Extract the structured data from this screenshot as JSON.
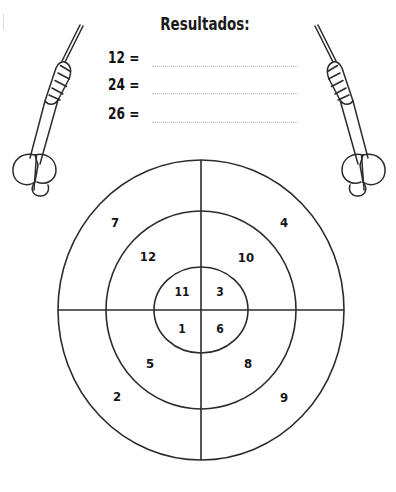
{
  "worksheet": {
    "results": {
      "title": "Resultados:",
      "rows": [
        {
          "label": "12 =",
          "answer": ""
        },
        {
          "label": "24 =",
          "answer": ""
        },
        {
          "label": "26 =",
          "answer": ""
        }
      ]
    },
    "dartboard": {
      "rings": [
        {
          "name": "outer-ring",
          "segments": [
            {
              "position": "top-left",
              "value": "7"
            },
            {
              "position": "top-right",
              "value": "4"
            },
            {
              "position": "bottom-left",
              "value": "2"
            },
            {
              "position": "bottom-right",
              "value": "9"
            }
          ]
        },
        {
          "name": "middle-ring",
          "segments": [
            {
              "position": "top-left",
              "value": "12"
            },
            {
              "position": "top-right",
              "value": "10"
            },
            {
              "position": "bottom-left",
              "value": "5"
            },
            {
              "position": "bottom-right",
              "value": "8"
            }
          ]
        },
        {
          "name": "inner-circle",
          "segments": [
            {
              "position": "top-left",
              "value": "11"
            },
            {
              "position": "top-right",
              "value": "3"
            },
            {
              "position": "bottom-left",
              "value": "1"
            },
            {
              "position": "bottom-right",
              "value": "6"
            }
          ]
        }
      ]
    },
    "darts": [
      {
        "name": "dart-left",
        "orientation": "needle-up-right"
      },
      {
        "name": "dart-right",
        "orientation": "needle-up-left"
      }
    ],
    "colors": {
      "ink": "#141414",
      "line": "#2b2b2b",
      "dotted": "#b9b9b9",
      "paper": "#ffffff"
    }
  }
}
